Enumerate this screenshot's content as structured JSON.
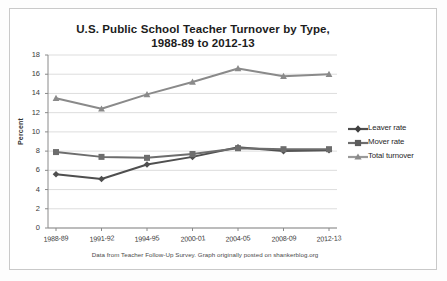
{
  "chart_data": {
    "type": "line",
    "title": "U.S. Public School Teacher Turnover by Type,",
    "title_line2": "1988-89 to 2012-13",
    "xlabel": "",
    "ylabel": "Percent",
    "ylim": [
      0,
      18
    ],
    "yticks": [
      0,
      2,
      4,
      6,
      8,
      10,
      12,
      14,
      16,
      18
    ],
    "grid": true,
    "legend_position": "right",
    "categories": [
      "1988-89",
      "1991-92",
      "1994-95",
      "2000-01",
      "2004-05",
      "2008-09",
      "2012-13"
    ],
    "series": [
      {
        "name": "Leaver rate",
        "marker": "diamond",
        "color": "#4f4f4f",
        "values": [
          5.6,
          5.1,
          6.6,
          7.4,
          8.4,
          8.0,
          8.1
        ]
      },
      {
        "name": "Mover rate",
        "marker": "square",
        "color": "#6d6d6d",
        "values": [
          7.9,
          7.4,
          7.3,
          7.7,
          8.3,
          8.2,
          8.2
        ]
      },
      {
        "name": "Total turnover",
        "marker": "triangle",
        "color": "#8a8a8a",
        "values": [
          13.5,
          12.4,
          13.9,
          15.2,
          16.6,
          15.8,
          16.0
        ]
      }
    ],
    "footnote": "Data from Teacher Follow-Up Survey.  Graph originally posted on shankerblog.org"
  },
  "legend": {
    "items": [
      {
        "label": "Leaver rate"
      },
      {
        "label": "Mover rate"
      },
      {
        "label": "Total turnover"
      }
    ]
  }
}
